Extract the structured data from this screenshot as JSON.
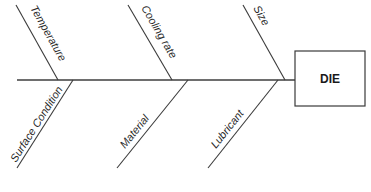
{
  "diagram": {
    "type": "fishbone",
    "effect": "DIE",
    "causes_top": [
      {
        "label": "Temperature"
      },
      {
        "label": "Cooling rate"
      },
      {
        "label": "Size"
      }
    ],
    "causes_bottom": [
      {
        "label": "Surface Condition"
      },
      {
        "label": "Material"
      },
      {
        "label": "Lubricant"
      }
    ],
    "colors": {
      "line": "#3a3a3a",
      "spine": "#6e6e6e",
      "background": "#ffffff"
    }
  }
}
